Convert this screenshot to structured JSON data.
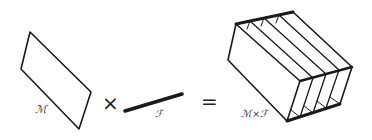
{
  "diagram": {
    "base_manifold": {
      "label": "ℳ"
    },
    "operator_times": {
      "symbol": "×"
    },
    "fiber": {
      "label": "ℱ"
    },
    "operator_equals": {
      "symbol": "="
    },
    "product_space": {
      "label": "ℳ×ℱ"
    },
    "colors": {
      "stroke": "#1a1a1a",
      "background": "#ffffff"
    }
  }
}
